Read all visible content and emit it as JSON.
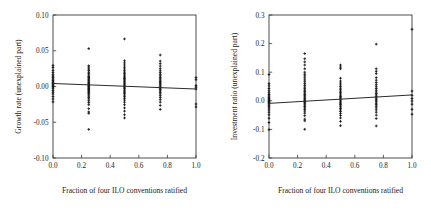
{
  "figure": {
    "background": "#ffffff",
    "foreground": "#1a1a1a",
    "panel_count": 2
  },
  "chart_data": [
    {
      "type": "scatter",
      "panel": "left",
      "title": "",
      "xlabel": "Fraction of four ILO conventions ratified",
      "ylabel": "Growth rate (unexplained part)",
      "xlim": [
        0.0,
        1.0
      ],
      "ylim": [
        -0.1,
        0.1
      ],
      "xticks": [
        0.0,
        0.2,
        0.4,
        0.6,
        0.8,
        1.0
      ],
      "xticklabels": [
        "0.0",
        "0.2",
        "0.4",
        "0.6",
        "0.8",
        "1.0"
      ],
      "yticks": [
        -0.1,
        -0.05,
        0.0,
        0.05,
        0.1
      ],
      "yticklabels": [
        "-0.10",
        "-0.05",
        "0.00",
        "0.05",
        "0.10"
      ],
      "grid": false,
      "legend": null,
      "marker": "plus",
      "fit_line": {
        "type": "linear",
        "x": [
          0.0,
          1.0
        ],
        "y": [
          0.0042,
          -0.0035
        ],
        "slope": -0.0077,
        "intercept": 0.0042
      },
      "points": [
        {
          "x": 0.0,
          "y": 0.0295
        },
        {
          "x": 0.0,
          "y": 0.0265
        },
        {
          "x": 0.0,
          "y": 0.0225
        },
        {
          "x": 0.0,
          "y": 0.0195
        },
        {
          "x": 0.0,
          "y": 0.0165
        },
        {
          "x": 0.0,
          "y": 0.0145
        },
        {
          "x": 0.0,
          "y": 0.0125
        },
        {
          "x": 0.0,
          "y": 0.0105
        },
        {
          "x": 0.0,
          "y": 0.0085
        },
        {
          "x": 0.0,
          "y": 0.0065
        },
        {
          "x": 0.0,
          "y": 0.005
        },
        {
          "x": 0.0,
          "y": 0.0035
        },
        {
          "x": 0.0,
          "y": 0.002
        },
        {
          "x": 0.0,
          "y": 0.0005
        },
        {
          "x": 0.0,
          "y": -0.001
        },
        {
          "x": 0.0,
          "y": -0.003
        },
        {
          "x": 0.0,
          "y": -0.0055
        },
        {
          "x": 0.0,
          "y": -0.008
        },
        {
          "x": 0.0,
          "y": -0.0105
        },
        {
          "x": 0.0,
          "y": -0.014
        },
        {
          "x": 0.0,
          "y": -0.0175
        },
        {
          "x": 0.0,
          "y": -0.0215
        },
        {
          "x": 0.25,
          "y": 0.053
        },
        {
          "x": 0.25,
          "y": 0.029
        },
        {
          "x": 0.25,
          "y": 0.027
        },
        {
          "x": 0.25,
          "y": 0.0245
        },
        {
          "x": 0.25,
          "y": 0.0225
        },
        {
          "x": 0.25,
          "y": 0.02
        },
        {
          "x": 0.25,
          "y": 0.018
        },
        {
          "x": 0.25,
          "y": 0.016
        },
        {
          "x": 0.25,
          "y": 0.014
        },
        {
          "x": 0.25,
          "y": 0.0125
        },
        {
          "x": 0.25,
          "y": 0.011
        },
        {
          "x": 0.25,
          "y": 0.0095
        },
        {
          "x": 0.25,
          "y": 0.008
        },
        {
          "x": 0.25,
          "y": 0.0065
        },
        {
          "x": 0.25,
          "y": 0.0052
        },
        {
          "x": 0.25,
          "y": 0.004
        },
        {
          "x": 0.25,
          "y": 0.0028
        },
        {
          "x": 0.25,
          "y": 0.0016
        },
        {
          "x": 0.25,
          "y": 0.0005
        },
        {
          "x": 0.25,
          "y": -0.0006
        },
        {
          "x": 0.25,
          "y": -0.0018
        },
        {
          "x": 0.25,
          "y": -0.003
        },
        {
          "x": 0.25,
          "y": -0.0042
        },
        {
          "x": 0.25,
          "y": -0.0055
        },
        {
          "x": 0.25,
          "y": -0.007
        },
        {
          "x": 0.25,
          "y": -0.0085
        },
        {
          "x": 0.25,
          "y": -0.01
        },
        {
          "x": 0.25,
          "y": -0.0118
        },
        {
          "x": 0.25,
          "y": -0.0135
        },
        {
          "x": 0.25,
          "y": -0.0155
        },
        {
          "x": 0.25,
          "y": -0.0175
        },
        {
          "x": 0.25,
          "y": -0.02
        },
        {
          "x": 0.25,
          "y": -0.0225
        },
        {
          "x": 0.25,
          "y": -0.0255
        },
        {
          "x": 0.25,
          "y": -0.031
        },
        {
          "x": 0.25,
          "y": -0.0355
        },
        {
          "x": 0.25,
          "y": -0.0375
        },
        {
          "x": 0.25,
          "y": -0.06
        },
        {
          "x": 0.5,
          "y": 0.0665
        },
        {
          "x": 0.5,
          "y": 0.036
        },
        {
          "x": 0.5,
          "y": 0.033
        },
        {
          "x": 0.5,
          "y": 0.03
        },
        {
          "x": 0.5,
          "y": 0.027
        },
        {
          "x": 0.5,
          "y": 0.0245
        },
        {
          "x": 0.5,
          "y": 0.022
        },
        {
          "x": 0.5,
          "y": 0.02
        },
        {
          "x": 0.5,
          "y": 0.018
        },
        {
          "x": 0.5,
          "y": 0.0162
        },
        {
          "x": 0.5,
          "y": 0.0145
        },
        {
          "x": 0.5,
          "y": 0.0128
        },
        {
          "x": 0.5,
          "y": 0.0112
        },
        {
          "x": 0.5,
          "y": 0.0096
        },
        {
          "x": 0.5,
          "y": 0.008
        },
        {
          "x": 0.5,
          "y": 0.0065
        },
        {
          "x": 0.5,
          "y": 0.005
        },
        {
          "x": 0.5,
          "y": 0.0036
        },
        {
          "x": 0.5,
          "y": 0.0022
        },
        {
          "x": 0.5,
          "y": 0.0008
        },
        {
          "x": 0.5,
          "y": -0.0006
        },
        {
          "x": 0.5,
          "y": -0.002
        },
        {
          "x": 0.5,
          "y": -0.0034
        },
        {
          "x": 0.5,
          "y": -0.005
        },
        {
          "x": 0.5,
          "y": -0.0066
        },
        {
          "x": 0.5,
          "y": -0.0082
        },
        {
          "x": 0.5,
          "y": -0.01
        },
        {
          "x": 0.5,
          "y": -0.012
        },
        {
          "x": 0.5,
          "y": -0.0142
        },
        {
          "x": 0.5,
          "y": -0.0165
        },
        {
          "x": 0.5,
          "y": -0.019
        },
        {
          "x": 0.5,
          "y": -0.022
        },
        {
          "x": 0.5,
          "y": -0.0255
        },
        {
          "x": 0.5,
          "y": -0.03
        },
        {
          "x": 0.5,
          "y": -0.0345
        },
        {
          "x": 0.5,
          "y": -0.0395
        },
        {
          "x": 0.5,
          "y": -0.044
        },
        {
          "x": 0.75,
          "y": 0.044
        },
        {
          "x": 0.75,
          "y": 0.0355
        },
        {
          "x": 0.75,
          "y": 0.032
        },
        {
          "x": 0.75,
          "y": 0.0285
        },
        {
          "x": 0.75,
          "y": 0.025
        },
        {
          "x": 0.75,
          "y": 0.022
        },
        {
          "x": 0.75,
          "y": 0.0195
        },
        {
          "x": 0.75,
          "y": 0.017
        },
        {
          "x": 0.75,
          "y": 0.0148
        },
        {
          "x": 0.75,
          "y": 0.0128
        },
        {
          "x": 0.75,
          "y": 0.0108
        },
        {
          "x": 0.75,
          "y": 0.009
        },
        {
          "x": 0.75,
          "y": 0.0072
        },
        {
          "x": 0.75,
          "y": 0.0055
        },
        {
          "x": 0.75,
          "y": 0.0038
        },
        {
          "x": 0.75,
          "y": 0.0022
        },
        {
          "x": 0.75,
          "y": 0.0006
        },
        {
          "x": 0.75,
          "y": -0.001
        },
        {
          "x": 0.75,
          "y": -0.0026
        },
        {
          "x": 0.75,
          "y": -0.0044
        },
        {
          "x": 0.75,
          "y": -0.0062
        },
        {
          "x": 0.75,
          "y": -0.0082
        },
        {
          "x": 0.75,
          "y": -0.0104
        },
        {
          "x": 0.75,
          "y": -0.0128
        },
        {
          "x": 0.75,
          "y": -0.0155
        },
        {
          "x": 0.75,
          "y": -0.0185
        },
        {
          "x": 0.75,
          "y": -0.022
        },
        {
          "x": 0.75,
          "y": -0.0265
        },
        {
          "x": 0.75,
          "y": -0.032
        },
        {
          "x": 1.0,
          "y": 0.0125
        },
        {
          "x": 1.0,
          "y": 0.0095
        },
        {
          "x": 1.0,
          "y": 0.0015
        },
        {
          "x": 1.0,
          "y": -0.001
        },
        {
          "x": 1.0,
          "y": -0.0035
        },
        {
          "x": 1.0,
          "y": -0.0245
        },
        {
          "x": 1.0,
          "y": -0.0285
        }
      ]
    },
    {
      "type": "scatter",
      "panel": "right",
      "title": "",
      "xlabel": "Fraction of four ILO conventions ratified",
      "ylabel": "Investment ratio (unexplained part)",
      "xlim": [
        0.0,
        1.0
      ],
      "ylim": [
        -0.2,
        0.3
      ],
      "xticks": [
        0.0,
        0.2,
        0.4,
        0.6,
        0.8,
        1.0
      ],
      "xticklabels": [
        "0.0",
        "0.2",
        "0.4",
        "0.6",
        "0.8",
        "1.0"
      ],
      "yticks": [
        -0.2,
        -0.1,
        0.0,
        0.1,
        0.2,
        0.3
      ],
      "yticklabels": [
        "-0.2",
        "-0.1",
        "0.0",
        "0.1",
        "0.2",
        "0.3"
      ],
      "grid": false,
      "legend": null,
      "marker": "plus",
      "fit_line": {
        "type": "linear",
        "x": [
          0.0,
          1.0
        ],
        "y": [
          -0.009,
          0.0205
        ],
        "slope": 0.0295,
        "intercept": -0.009
      },
      "points": [
        {
          "x": 0.0,
          "y": 0.092
        },
        {
          "x": 0.0,
          "y": 0.06
        },
        {
          "x": 0.0,
          "y": 0.052
        },
        {
          "x": 0.0,
          "y": 0.043
        },
        {
          "x": 0.0,
          "y": 0.035
        },
        {
          "x": 0.0,
          "y": 0.028
        },
        {
          "x": 0.0,
          "y": 0.022
        },
        {
          "x": 0.0,
          "y": 0.017
        },
        {
          "x": 0.0,
          "y": 0.0125
        },
        {
          "x": 0.0,
          "y": 0.0085
        },
        {
          "x": 0.0,
          "y": 0.0045
        },
        {
          "x": 0.0,
          "y": 0.001
        },
        {
          "x": 0.0,
          "y": -0.0025
        },
        {
          "x": 0.0,
          "y": -0.006
        },
        {
          "x": 0.0,
          "y": -0.01
        },
        {
          "x": 0.0,
          "y": -0.0145
        },
        {
          "x": 0.0,
          "y": -0.0195
        },
        {
          "x": 0.0,
          "y": -0.0255
        },
        {
          "x": 0.0,
          "y": -0.032
        },
        {
          "x": 0.0,
          "y": -0.04
        },
        {
          "x": 0.0,
          "y": -0.049
        },
        {
          "x": 0.0,
          "y": -0.061
        },
        {
          "x": 0.0,
          "y": -0.076
        },
        {
          "x": 0.0,
          "y": -0.101
        },
        {
          "x": 0.25,
          "y": 0.165
        },
        {
          "x": 0.25,
          "y": 0.147
        },
        {
          "x": 0.25,
          "y": 0.136
        },
        {
          "x": 0.25,
          "y": 0.125
        },
        {
          "x": 0.25,
          "y": 0.112
        },
        {
          "x": 0.25,
          "y": 0.1
        },
        {
          "x": 0.25,
          "y": 0.093
        },
        {
          "x": 0.25,
          "y": 0.087
        },
        {
          "x": 0.25,
          "y": 0.08
        },
        {
          "x": 0.25,
          "y": 0.073
        },
        {
          "x": 0.25,
          "y": 0.0665
        },
        {
          "x": 0.25,
          "y": 0.06
        },
        {
          "x": 0.25,
          "y": 0.054
        },
        {
          "x": 0.25,
          "y": 0.048
        },
        {
          "x": 0.25,
          "y": 0.0425
        },
        {
          "x": 0.25,
          "y": 0.037
        },
        {
          "x": 0.25,
          "y": 0.032
        },
        {
          "x": 0.25,
          "y": 0.027
        },
        {
          "x": 0.25,
          "y": 0.0225
        },
        {
          "x": 0.25,
          "y": 0.018
        },
        {
          "x": 0.25,
          "y": 0.0135
        },
        {
          "x": 0.25,
          "y": 0.0095
        },
        {
          "x": 0.25,
          "y": 0.0055
        },
        {
          "x": 0.25,
          "y": 0.0015
        },
        {
          "x": 0.25,
          "y": -0.0025
        },
        {
          "x": 0.25,
          "y": -0.0065
        },
        {
          "x": 0.25,
          "y": -0.0105
        },
        {
          "x": 0.25,
          "y": -0.015
        },
        {
          "x": 0.25,
          "y": -0.0195
        },
        {
          "x": 0.25,
          "y": -0.0245
        },
        {
          "x": 0.25,
          "y": -0.03
        },
        {
          "x": 0.25,
          "y": -0.036
        },
        {
          "x": 0.25,
          "y": -0.043
        },
        {
          "x": 0.25,
          "y": -0.052
        },
        {
          "x": 0.25,
          "y": -0.064
        },
        {
          "x": 0.25,
          "y": -0.07
        },
        {
          "x": 0.25,
          "y": -0.0995
        },
        {
          "x": 0.5,
          "y": 0.125
        },
        {
          "x": 0.5,
          "y": 0.118
        },
        {
          "x": 0.5,
          "y": 0.112
        },
        {
          "x": 0.5,
          "y": 0.079
        },
        {
          "x": 0.5,
          "y": 0.069
        },
        {
          "x": 0.5,
          "y": 0.062
        },
        {
          "x": 0.5,
          "y": 0.0555
        },
        {
          "x": 0.5,
          "y": 0.0495
        },
        {
          "x": 0.5,
          "y": 0.044
        },
        {
          "x": 0.5,
          "y": 0.0385
        },
        {
          "x": 0.5,
          "y": 0.0335
        },
        {
          "x": 0.5,
          "y": 0.0285
        },
        {
          "x": 0.5,
          "y": 0.024
        },
        {
          "x": 0.5,
          "y": 0.0195
        },
        {
          "x": 0.5,
          "y": 0.015
        },
        {
          "x": 0.5,
          "y": 0.011
        },
        {
          "x": 0.5,
          "y": 0.007
        },
        {
          "x": 0.5,
          "y": 0.003
        },
        {
          "x": 0.5,
          "y": -0.001
        },
        {
          "x": 0.5,
          "y": -0.005
        },
        {
          "x": 0.5,
          "y": -0.009
        },
        {
          "x": 0.5,
          "y": -0.013
        },
        {
          "x": 0.5,
          "y": -0.0175
        },
        {
          "x": 0.5,
          "y": -0.022
        },
        {
          "x": 0.5,
          "y": -0.027
        },
        {
          "x": 0.5,
          "y": -0.032
        },
        {
          "x": 0.5,
          "y": -0.0375
        },
        {
          "x": 0.5,
          "y": -0.044
        },
        {
          "x": 0.5,
          "y": -0.051
        },
        {
          "x": 0.5,
          "y": -0.06
        },
        {
          "x": 0.5,
          "y": -0.072
        },
        {
          "x": 0.5,
          "y": -0.087
        },
        {
          "x": 0.75,
          "y": 0.198
        },
        {
          "x": 0.75,
          "y": 0.112
        },
        {
          "x": 0.75,
          "y": 0.103
        },
        {
          "x": 0.75,
          "y": 0.095
        },
        {
          "x": 0.75,
          "y": 0.081
        },
        {
          "x": 0.75,
          "y": 0.072
        },
        {
          "x": 0.75,
          "y": 0.064
        },
        {
          "x": 0.75,
          "y": 0.0565
        },
        {
          "x": 0.75,
          "y": 0.0495
        },
        {
          "x": 0.75,
          "y": 0.043
        },
        {
          "x": 0.75,
          "y": 0.037
        },
        {
          "x": 0.75,
          "y": 0.031
        },
        {
          "x": 0.75,
          "y": 0.0255
        },
        {
          "x": 0.75,
          "y": 0.0205
        },
        {
          "x": 0.75,
          "y": 0.0155
        },
        {
          "x": 0.75,
          "y": 0.0105
        },
        {
          "x": 0.75,
          "y": 0.006
        },
        {
          "x": 0.75,
          "y": 0.0015
        },
        {
          "x": 0.75,
          "y": -0.0035
        },
        {
          "x": 0.75,
          "y": -0.0085
        },
        {
          "x": 0.75,
          "y": -0.0135
        },
        {
          "x": 0.75,
          "y": -0.019
        },
        {
          "x": 0.75,
          "y": -0.025
        },
        {
          "x": 0.75,
          "y": -0.032
        },
        {
          "x": 0.75,
          "y": -0.04
        },
        {
          "x": 0.75,
          "y": -0.05
        },
        {
          "x": 0.75,
          "y": -0.062
        },
        {
          "x": 0.75,
          "y": -0.088
        },
        {
          "x": 1.0,
          "y": 0.25
        },
        {
          "x": 1.0,
          "y": 0.034
        },
        {
          "x": 1.0,
          "y": 0.019
        },
        {
          "x": 1.0,
          "y": 0.008
        },
        {
          "x": 1.0,
          "y": -0.001
        },
        {
          "x": 1.0,
          "y": -0.012
        },
        {
          "x": 1.0,
          "y": -0.03
        },
        {
          "x": 1.0,
          "y": -0.047
        }
      ]
    }
  ]
}
